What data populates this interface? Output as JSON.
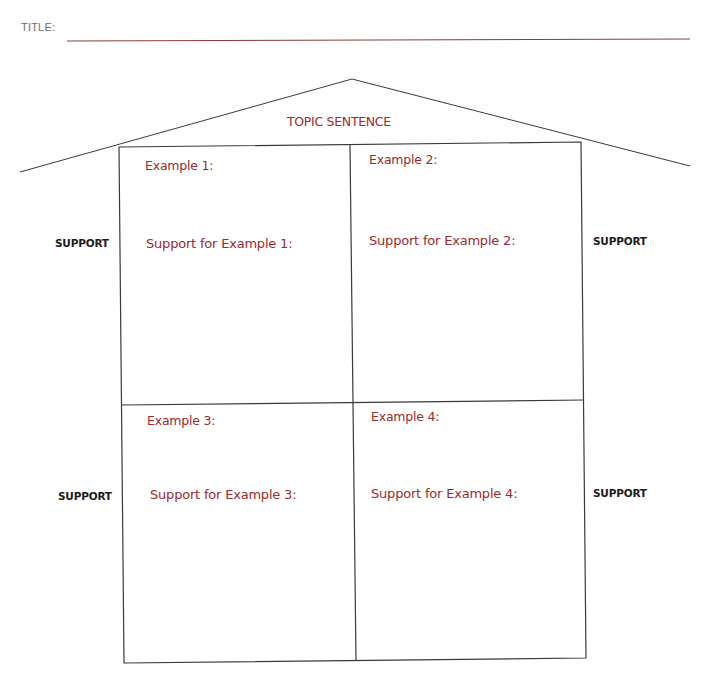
{
  "header": {
    "title_label": "TITLE:",
    "title_value": ""
  },
  "roof": {
    "topic_label": "TOPIC SENTENCE"
  },
  "boxes": [
    {
      "example_label": "Example 1:",
      "support_label": "Support for Example 1:"
    },
    {
      "example_label": "Example 2:",
      "support_label": "Support for Example 2:"
    },
    {
      "example_label": "Example 3:",
      "support_label": "Support for Example 3:"
    },
    {
      "example_label": "Example 4:",
      "support_label": "Support for Example 4:"
    }
  ],
  "side_labels": {
    "left_top": "SUPPORT",
    "right_top": "SUPPORT",
    "left_bottom": "SUPPORT",
    "right_bottom": "SUPPORT"
  },
  "colors": {
    "accent_red": "#9b2a2e",
    "line": "#3a3a3a",
    "title_line": "#8a3a3a"
  }
}
